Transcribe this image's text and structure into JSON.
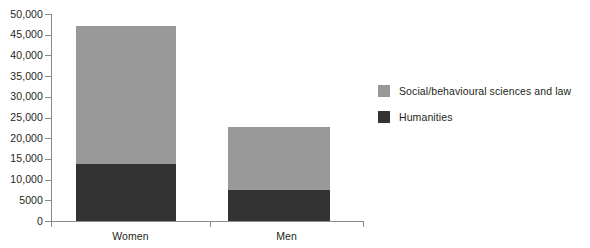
{
  "chart_data": {
    "type": "bar",
    "subtype": "stacked-bar",
    "title": "",
    "xlabel": "",
    "ylabel": "",
    "categories": [
      "Women",
      "Men"
    ],
    "series": [
      {
        "name": "Humanities",
        "color": "#333333",
        "values": [
          13800,
          7500
        ]
      },
      {
        "name": "Social/behavioural sciences and law",
        "color": "#999999",
        "values": [
          33300,
          15200
        ]
      }
    ],
    "totals": [
      47100,
      22700
    ],
    "ylim": [
      0,
      50000
    ],
    "yticks": [
      0,
      5000,
      10000,
      15000,
      20000,
      25000,
      30000,
      35000,
      40000,
      45000,
      50000
    ],
    "ytick_labels": [
      "0",
      "5000",
      "10,000",
      "15,000",
      "20,000",
      "25,000",
      "30,000",
      "35,000",
      "40,000",
      "45,000",
      "50,000"
    ],
    "grid": false,
    "legend_position": "right"
  },
  "axis": {
    "y_labels": [
      {
        "value": 50000,
        "text": "50,000"
      },
      {
        "value": 45000,
        "text": "45,000"
      },
      {
        "value": 40000,
        "text": "40,000"
      },
      {
        "value": 35000,
        "text": "35,000"
      },
      {
        "value": 30000,
        "text": "30,000"
      },
      {
        "value": 25000,
        "text": "25,000"
      },
      {
        "value": 20000,
        "text": "20,000"
      },
      {
        "value": 15000,
        "text": "15,000"
      },
      {
        "value": 10000,
        "text": "10,000"
      },
      {
        "value": 5000,
        "text": "5000"
      },
      {
        "value": 0,
        "text": "0"
      }
    ],
    "x_labels": [
      "Women",
      "Men"
    ],
    "axis_color": "#8a8a8a"
  },
  "legend": {
    "items": [
      {
        "label": "Social/behavioural sciences and law",
        "color": "#999999"
      },
      {
        "label": "Humanities",
        "color": "#333333"
      }
    ]
  }
}
